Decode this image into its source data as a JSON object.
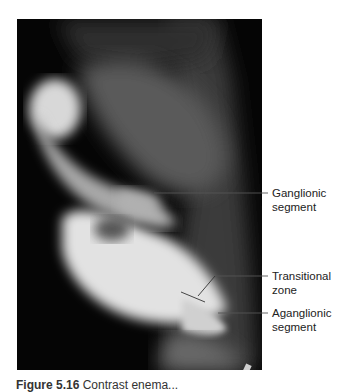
{
  "figure": {
    "type": "radiograph",
    "background_color": "#050505",
    "labels": [
      {
        "id": "ganglionic",
        "line1": "Ganglionic",
        "line2": "segment"
      },
      {
        "id": "transitional",
        "line1": "Transitional",
        "line2": "zone"
      },
      {
        "id": "aganglionic",
        "line1": "Aganglionic",
        "line2": "segment"
      }
    ]
  },
  "caption": {
    "prefix": "Figure 5.16",
    "text": " Contrast enema..."
  }
}
